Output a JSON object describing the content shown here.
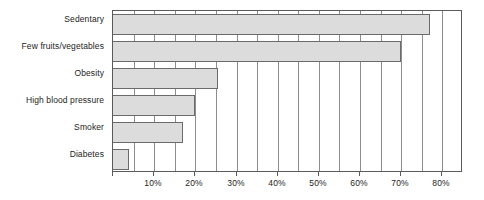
{
  "chart_data": {
    "type": "bar",
    "orientation": "horizontal",
    "title": "",
    "subtitle": "",
    "xlabel": "",
    "ylabel": "",
    "categories": [
      "Sedentary",
      "Few fruits/vegetables",
      "Obesity",
      "High blood pressure",
      "Smoker",
      "Diabetes"
    ],
    "values": [
      77,
      70,
      25.5,
      20,
      17,
      4
    ],
    "value_unit": "%",
    "xlim": [
      0,
      85
    ],
    "ylim": null,
    "xticks": [
      0,
      10,
      20,
      30,
      40,
      50,
      60,
      70,
      80
    ],
    "xtick_labels": [
      "",
      "10%",
      "20%",
      "30%",
      "40%",
      "50%",
      "60%",
      "70%",
      "80%"
    ],
    "minor_xticks": [
      0,
      5,
      10,
      15,
      20,
      25,
      30,
      35,
      40,
      45,
      50,
      55,
      60,
      65,
      70,
      75,
      80,
      85
    ],
    "grid": true,
    "grid_axis": "x",
    "legend": null,
    "legend_position": "none",
    "annotations": [],
    "series": [
      {
        "name": "Prevalence",
        "values": [
          77,
          70,
          25.5,
          20,
          17,
          4
        ]
      }
    ]
  },
  "style": {
    "bar_fill": "#dcdcdc",
    "bar_border": "#6b6b6b",
    "grid_color": "#8d8d8d",
    "axis_color": "#5a5a5a",
    "text_color": "#1d1d1d",
    "background": "#ffffff"
  }
}
